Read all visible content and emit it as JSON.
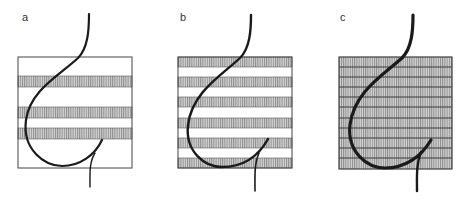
{
  "figure": {
    "background": "#ffffff",
    "stroke_color": "#1a1a1a",
    "hatch_color": "#8a8a8a",
    "hatch_bg": "#d6d6d6",
    "box_border": "#444444",
    "panels": [
      {
        "label": "a",
        "label_pos": [
          22,
          21
        ],
        "box": {
          "x": 18,
          "y": 57,
          "w": 114,
          "h": 111
        },
        "stripes": [
          [
            76,
            87
          ],
          [
            107,
            118
          ],
          [
            128,
            139
          ]
        ],
        "grid_lines": [],
        "curve_width": 2.2,
        "curve": "M 89 14 C 89 30, 88 48, 78 58 C 60 75, 30 90, 26 120 C 22 150, 45 166, 62 166 C 80 166, 95 155, 102 140",
        "tail": "M 90 187 C 90 175, 89 162, 95 153"
      },
      {
        "label": "b",
        "label_pos": [
          180,
          21
        ],
        "box": {
          "x": 178,
          "y": 57,
          "w": 114,
          "h": 111
        },
        "stripes": [
          [
            57,
            67
          ],
          [
            77,
            87
          ],
          [
            97,
            107
          ],
          [
            118,
            128
          ],
          [
            138,
            148
          ],
          [
            158,
            168
          ]
        ],
        "grid_lines": [],
        "curve_width": 2.4,
        "curve": "M 251 15 C 251 30, 250 48, 240 58 C 222 75, 192 92, 188 125 C 185 152, 205 167, 222 167 C 242 167, 258 157, 268 139",
        "tail": "M 255 191 C 255 178, 254 164, 259 153"
      },
      {
        "label": "c",
        "label_pos": [
          340,
          21
        ],
        "box": {
          "x": 339,
          "y": 57,
          "w": 113,
          "h": 112
        },
        "stripes": [
          [
            57,
            169
          ]
        ],
        "grid_lines": [
          67,
          77,
          87,
          97,
          107,
          118,
          128,
          138,
          148,
          158
        ],
        "curve_width": 3.2,
        "curve": "M 413 15 C 413 30, 412 48, 402 58 C 383 75, 354 92, 350 125 C 347 152, 367 168, 385 168 C 405 168, 421 157, 431 140",
        "tail": "M 417 191 C 417 178, 416 164, 421 152"
      }
    ]
  }
}
